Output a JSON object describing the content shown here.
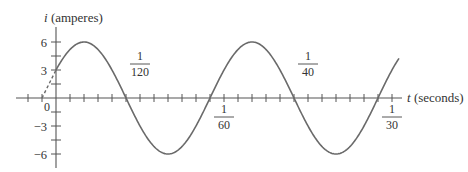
{
  "chart_data": {
    "type": "line",
    "title": "",
    "xlabel": "t (seconds)",
    "ylabel": "i (amperes)",
    "function": "i = 6 sin(120πt + π/6)",
    "amplitude": 6,
    "frequency_hz": 60,
    "phase_rad": 0.5236,
    "x_domain_plotted": [
      -0.00139,
      0.03403
    ],
    "dashed_segment": {
      "x": [
        -0.00139,
        0
      ],
      "y": [
        0,
        3
      ]
    },
    "y_ticks": [
      {
        "value": 6,
        "label": "6"
      },
      {
        "value": 4.5,
        "label": ""
      },
      {
        "value": 3,
        "label": "3"
      },
      {
        "value": 1.5,
        "label": ""
      },
      {
        "value": 0,
        "label": "0"
      },
      {
        "value": -1.5,
        "label": ""
      },
      {
        "value": -3,
        "label": "−3"
      },
      {
        "value": -4.5,
        "label": ""
      },
      {
        "value": -6,
        "label": "−6"
      }
    ],
    "x_tick_step": 0.0013889,
    "x_labels": [
      {
        "value": 0.008333,
        "num": "1",
        "den": "120",
        "position": "above"
      },
      {
        "value": 0.016667,
        "num": "1",
        "den": "60",
        "position": "below"
      },
      {
        "value": 0.025,
        "num": "1",
        "den": "40",
        "position": "above"
      },
      {
        "value": 0.033333,
        "num": "1",
        "den": "30",
        "position": "below"
      }
    ],
    "key_points": [
      {
        "t": 0,
        "i": 3
      },
      {
        "t": 0.002778,
        "i": 6
      },
      {
        "t": 0.006944,
        "i": 0
      },
      {
        "t": 0.011111,
        "i": -6
      },
      {
        "t": 0.015278,
        "i": 0
      },
      {
        "t": 0.019444,
        "i": 6
      },
      {
        "t": 0.023611,
        "i": 0
      },
      {
        "t": 0.027778,
        "i": -6
      },
      {
        "t": 0.031944,
        "i": 0
      }
    ],
    "ylim": [
      -7,
      7.5
    ],
    "grid": false,
    "legend": null
  },
  "labels": {
    "y_axis_var": "i",
    "y_axis_unit": " (amperes)",
    "x_axis_var": "t",
    "x_axis_unit": " (seconds)",
    "origin": "0"
  }
}
